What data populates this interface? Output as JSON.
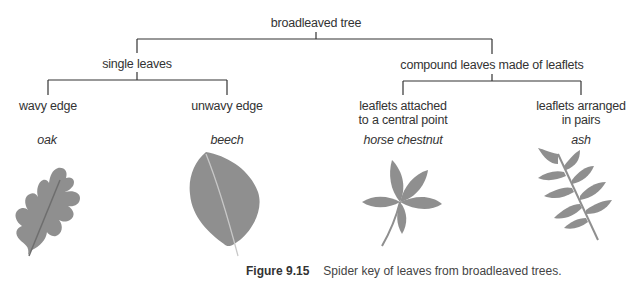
{
  "diagram": {
    "root": "broadleaved tree",
    "level1": {
      "left": "single leaves",
      "right": "compound leaves made of leaflets"
    },
    "level2": [
      {
        "label": "wavy edge",
        "species": "oak"
      },
      {
        "label": "unwavy edge",
        "species": "beech"
      },
      {
        "label_line1": "leaflets attached",
        "label_line2": "to a central point",
        "species": "horse chestnut"
      },
      {
        "label_line1": "leaflets arranged",
        "label_line2": "in pairs",
        "species": "ash"
      }
    ],
    "colors": {
      "leaf": "#8f8f8f",
      "vein": "#6e6e6e",
      "line": "#333333"
    }
  },
  "caption": {
    "figure": "Figure 9.15",
    "text": "Spider key of leaves from broadleaved trees."
  }
}
